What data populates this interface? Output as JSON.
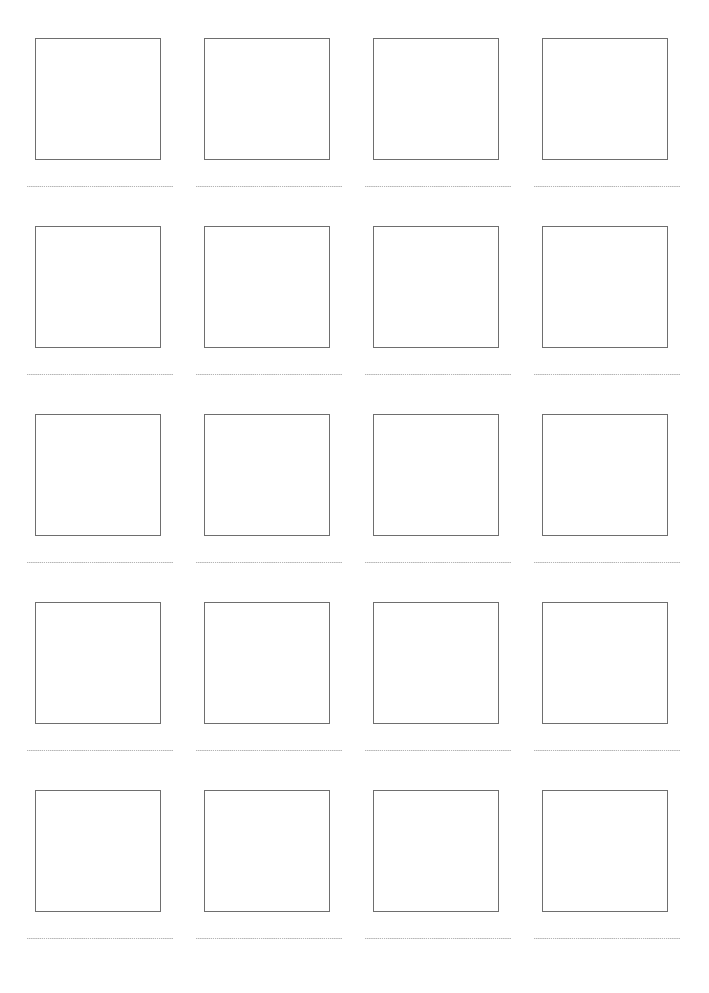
{
  "document": {
    "type": "worksheet-template",
    "title": "",
    "page_width": 709,
    "page_height": 993,
    "background_color": "#ffffff"
  },
  "grid": {
    "rows": 5,
    "columns": 4,
    "total_cells": 20,
    "column_pitch": 169,
    "row_pitch": 188,
    "first_column_left": 27,
    "first_row_top": 38
  },
  "styles": {
    "box_border_color": "#6e6e6e",
    "box_border_width": "1.5px",
    "box_fill_color": "#ffffff",
    "box_width": 126,
    "box_height": 122,
    "line_color": "#b4b4b4",
    "line_style": "dotted",
    "line_width": 146
  },
  "cells": [
    {
      "id": "cell-r1-c1",
      "row": 1,
      "column": 1,
      "box_label": "",
      "line_text": ""
    },
    {
      "id": "cell-r1-c2",
      "row": 1,
      "column": 2,
      "box_label": "",
      "line_text": ""
    },
    {
      "id": "cell-r1-c3",
      "row": 1,
      "column": 3,
      "box_label": "",
      "line_text": ""
    },
    {
      "id": "cell-r1-c4",
      "row": 1,
      "column": 4,
      "box_label": "",
      "line_text": ""
    },
    {
      "id": "cell-r2-c1",
      "row": 2,
      "column": 1,
      "box_label": "",
      "line_text": ""
    },
    {
      "id": "cell-r2-c2",
      "row": 2,
      "column": 2,
      "box_label": "",
      "line_text": ""
    },
    {
      "id": "cell-r2-c3",
      "row": 2,
      "column": 3,
      "box_label": "",
      "line_text": ""
    },
    {
      "id": "cell-r2-c4",
      "row": 2,
      "column": 4,
      "box_label": "",
      "line_text": ""
    },
    {
      "id": "cell-r3-c1",
      "row": 3,
      "column": 1,
      "box_label": "",
      "line_text": ""
    },
    {
      "id": "cell-r3-c2",
      "row": 3,
      "column": 2,
      "box_label": "",
      "line_text": ""
    },
    {
      "id": "cell-r3-c3",
      "row": 3,
      "column": 3,
      "box_label": "",
      "line_text": ""
    },
    {
      "id": "cell-r3-c4",
      "row": 3,
      "column": 4,
      "box_label": "",
      "line_text": ""
    },
    {
      "id": "cell-r4-c1",
      "row": 4,
      "column": 1,
      "box_label": "",
      "line_text": ""
    },
    {
      "id": "cell-r4-c2",
      "row": 4,
      "column": 2,
      "box_label": "",
      "line_text": ""
    },
    {
      "id": "cell-r4-c3",
      "row": 4,
      "column": 3,
      "box_label": "",
      "line_text": ""
    },
    {
      "id": "cell-r4-c4",
      "row": 4,
      "column": 4,
      "box_label": "",
      "line_text": ""
    },
    {
      "id": "cell-r5-c1",
      "row": 5,
      "column": 1,
      "box_label": "",
      "line_text": ""
    },
    {
      "id": "cell-r5-c2",
      "row": 5,
      "column": 2,
      "box_label": "",
      "line_text": ""
    },
    {
      "id": "cell-r5-c3",
      "row": 5,
      "column": 3,
      "box_label": "",
      "line_text": ""
    },
    {
      "id": "cell-r5-c4",
      "row": 5,
      "column": 4,
      "box_label": "",
      "line_text": ""
    }
  ]
}
